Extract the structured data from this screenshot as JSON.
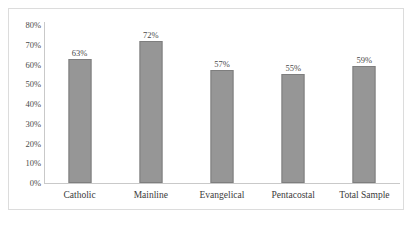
{
  "chart_data": {
    "type": "bar",
    "title": "",
    "xlabel": "",
    "ylabel": "",
    "categories": [
      "Catholic",
      "Mainline",
      "Evangelical",
      "Pentacostal",
      "Total Sample"
    ],
    "values": [
      63,
      72,
      57,
      55,
      59
    ],
    "value_labels": [
      "63%",
      "72%",
      "57%",
      "55%",
      "59%"
    ],
    "ylim": [
      0,
      80
    ],
    "ytick_labels": [
      "80%",
      "70%",
      "60%",
      "50%",
      "40%",
      "30%",
      "20%",
      "10%",
      "0%"
    ],
    "ytick_values": [
      80,
      70,
      60,
      50,
      40,
      30,
      20,
      10,
      0
    ],
    "grid": false,
    "legend": false,
    "bar_color": "#969696",
    "bar_border_color": "#7e7e7e",
    "plot_background": "#ffffff",
    "frame_color": "#dcdcdc",
    "axis_color": "#c9c9c9",
    "text_color": "#3a3a3a"
  }
}
